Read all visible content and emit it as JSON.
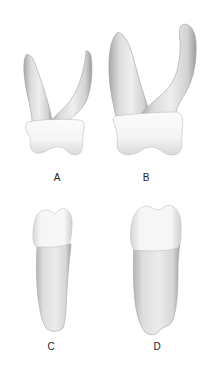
{
  "figure": {
    "panels": [
      {
        "id": "A",
        "label": "A",
        "description": "Two-rooted tooth, smaller, divergent roots",
        "label_pos": {
          "x": 57,
          "y": 173
        }
      },
      {
        "id": "B",
        "label": "B",
        "description": "Two-rooted tooth, larger, divergent roots",
        "label_pos": {
          "x": 146,
          "y": 173
        }
      },
      {
        "id": "C",
        "label": "C",
        "description": "Single-rooted tooth, narrow",
        "label_pos": {
          "x": 51,
          "y": 342
        }
      },
      {
        "id": "D",
        "label": "D",
        "description": "Single-rooted tooth, wider",
        "label_pos": {
          "x": 157,
          "y": 342
        }
      }
    ],
    "colors": {
      "background": "#ffffff",
      "crown_fill": "#f7f7f7",
      "root_fill": "#e4e4e4",
      "shadow": "#9a9a9a",
      "label": "#222222"
    }
  }
}
